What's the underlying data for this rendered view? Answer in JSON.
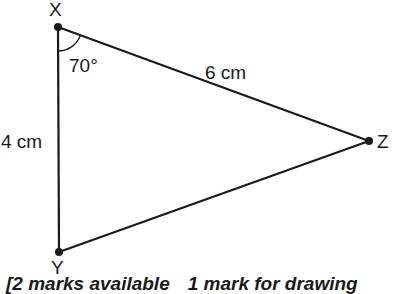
{
  "diagram": {
    "type": "triangle",
    "vertices": [
      {
        "name": "X",
        "x": 58,
        "y": 27
      },
      {
        "name": "Y",
        "x": 59,
        "y": 252
      },
      {
        "name": "Z",
        "x": 369,
        "y": 141
      }
    ],
    "labels": {
      "X": "X",
      "Y": "Y",
      "Z": "Z",
      "angle_x": "70°",
      "side_xz": "6 cm",
      "side_xy": "4 cm"
    },
    "stroke_color": "#1a1a1a"
  },
  "footer": {
    "marks_text": "[2 marks available",
    "drawing_text": "1 mark for drawing"
  }
}
